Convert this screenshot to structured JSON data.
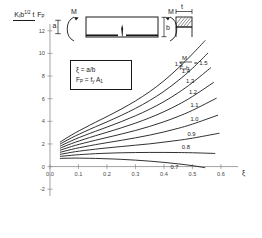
{
  "chart_data": {
    "type": "line",
    "title": "",
    "xlabel": "ξ",
    "ylabel": "K_I b^1/2 t / F_P",
    "xlim": [
      -0.035,
      0.66
    ],
    "ylim": [
      -2.6,
      12.6
    ],
    "xticks": [
      "0.0",
      "0.1",
      "0.2",
      "0.3",
      "0.4",
      "0.5",
      "0.6"
    ],
    "xtick_values": [
      0.0,
      0.1,
      0.2,
      0.3,
      0.4,
      0.5,
      0.6
    ],
    "yticks": [
      "0",
      "2",
      "4",
      "6",
      "8",
      "10",
      "12",
      "-2"
    ],
    "ytick_values": [
      0,
      2,
      4,
      6,
      8,
      10,
      12,
      -2
    ],
    "grid": false,
    "legend_position": "inline-right",
    "legend_title": "M / F_P b",
    "series": [
      {
        "name": "1.5",
        "label": "1.5",
        "x": [
          0.035,
          0.06,
          0.09,
          0.12,
          0.16,
          0.2,
          0.25,
          0.3,
          0.35,
          0.4,
          0.45,
          0.5,
          0.545
        ],
        "y": [
          2.15,
          2.55,
          3.0,
          3.4,
          3.92,
          4.42,
          5.08,
          5.8,
          6.62,
          7.58,
          8.7,
          9.95,
          11.15
        ]
      },
      {
        "name": "1.4",
        "label": "1.4",
        "x": [
          0.035,
          0.06,
          0.09,
          0.12,
          0.16,
          0.2,
          0.25,
          0.3,
          0.35,
          0.4,
          0.45,
          0.5,
          0.555
        ],
        "y": [
          1.98,
          2.33,
          2.72,
          3.07,
          3.52,
          3.95,
          4.52,
          5.14,
          5.84,
          6.65,
          7.6,
          8.68,
          10.05
        ]
      },
      {
        "name": "1.3",
        "label": "1.3",
        "x": [
          0.035,
          0.06,
          0.09,
          0.12,
          0.16,
          0.2,
          0.25,
          0.3,
          0.35,
          0.4,
          0.45,
          0.5,
          0.565
        ],
        "y": [
          1.8,
          2.1,
          2.44,
          2.74,
          3.12,
          3.49,
          3.97,
          4.49,
          5.07,
          5.74,
          6.52,
          7.42,
          8.75
        ]
      },
      {
        "name": "1.2",
        "label": "1.2",
        "x": [
          0.035,
          0.06,
          0.09,
          0.12,
          0.16,
          0.2,
          0.25,
          0.3,
          0.35,
          0.4,
          0.45,
          0.5,
          0.575
        ],
        "y": [
          1.62,
          1.88,
          2.16,
          2.41,
          2.73,
          3.03,
          3.42,
          3.84,
          4.31,
          4.85,
          5.47,
          6.19,
          7.45
        ]
      },
      {
        "name": "1.1",
        "label": "1.1",
        "x": [
          0.035,
          0.06,
          0.09,
          0.12,
          0.16,
          0.2,
          0.25,
          0.3,
          0.35,
          0.4,
          0.45,
          0.5,
          0.585
        ],
        "y": [
          1.44,
          1.65,
          1.88,
          2.08,
          2.33,
          2.57,
          2.87,
          3.19,
          3.55,
          3.96,
          4.43,
          4.97,
          6.05
        ]
      },
      {
        "name": "1.0",
        "label": "1.0",
        "x": [
          0.035,
          0.06,
          0.09,
          0.12,
          0.16,
          0.2,
          0.25,
          0.3,
          0.35,
          0.4,
          0.45,
          0.5,
          0.59
        ],
        "y": [
          1.26,
          1.42,
          1.6,
          1.75,
          1.94,
          2.11,
          2.32,
          2.54,
          2.78,
          3.06,
          3.38,
          3.75,
          4.55
        ]
      },
      {
        "name": "0.9",
        "label": "0.9",
        "x": [
          0.035,
          0.06,
          0.09,
          0.12,
          0.16,
          0.2,
          0.25,
          0.3,
          0.35,
          0.4,
          0.45,
          0.5,
          0.595
        ],
        "y": [
          1.08,
          1.19,
          1.32,
          1.42,
          1.54,
          1.65,
          1.77,
          1.89,
          2.01,
          2.16,
          2.32,
          2.51,
          2.95
        ]
      },
      {
        "name": "0.8",
        "label": "0.8",
        "x": [
          0.035,
          0.06,
          0.09,
          0.12,
          0.16,
          0.2,
          0.25,
          0.3,
          0.35,
          0.4,
          0.45,
          0.5,
          0.58
        ],
        "y": [
          0.9,
          0.96,
          1.03,
          1.08,
          1.14,
          1.18,
          1.22,
          1.24,
          1.25,
          1.25,
          1.24,
          1.22,
          1.16
        ]
      },
      {
        "name": "0.7",
        "label": "0.7",
        "x": [
          0.035,
          0.06,
          0.09,
          0.12,
          0.16,
          0.2,
          0.25,
          0.3,
          0.35,
          0.4,
          0.45,
          0.5,
          0.545
        ],
        "y": [
          0.72,
          0.74,
          0.75,
          0.74,
          0.72,
          0.69,
          0.64,
          0.57,
          0.48,
          0.37,
          0.24,
          0.08,
          -0.1
        ]
      }
    ]
  },
  "ylabel": {
    "numerator_k": "K",
    "numerator_k_sub": "I",
    "numerator_b": "b",
    "numerator_b_sup": "1/2",
    "numerator_t": "t",
    "denominator": "F",
    "denominator_sub": "P"
  },
  "definition_box": {
    "line1_left": "ξ",
    "line1_eq": " = a/b",
    "line2_f": "F",
    "line2_f_sub": "P",
    "line2_eq": " = f",
    "line2_y_sub": "y",
    "line2_a": " A",
    "line2_a_sub": "1"
  },
  "schematic": {
    "moment_left": "M",
    "moment_right": "M",
    "crack_depth": "a",
    "thickness": "t",
    "height": "b",
    "section_label": ""
  },
  "legend": {
    "numerator": "M",
    "denominator_f": "F",
    "denominator_f_sub": "P",
    "denominator_b": "b",
    "equals": "= 1.5"
  },
  "axes": {
    "x_name": "ξ",
    "y_name": ""
  }
}
